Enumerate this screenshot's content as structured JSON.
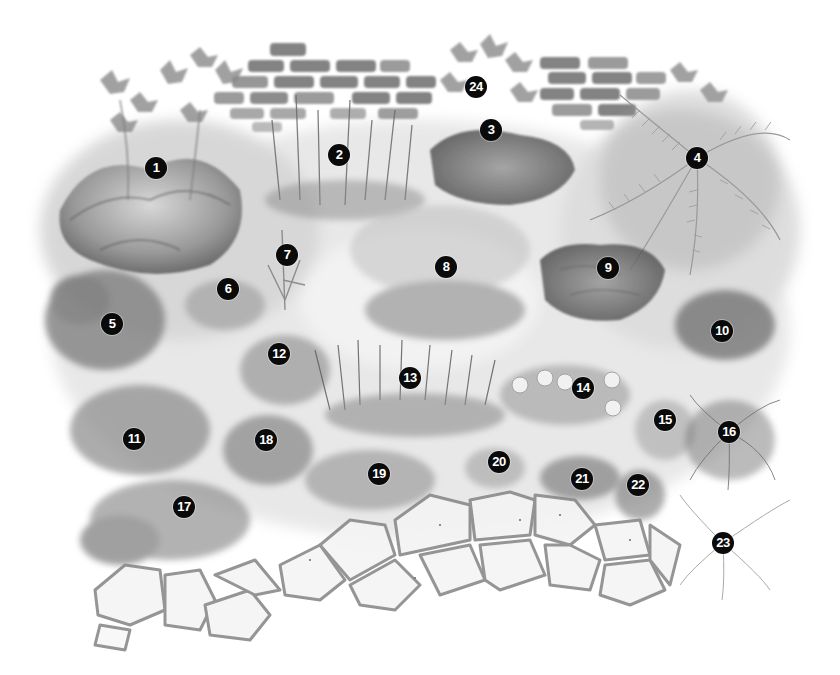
{
  "illustration": {
    "subject": "Watercolor garden border planting plan, grayscale",
    "background": "#ffffff",
    "elements": [
      "brick-wall-left",
      "brick-wall-right",
      "climbing-vines",
      "mixed-perennials",
      "ferns",
      "curved-flagstone-path"
    ]
  },
  "markers": [
    {
      "label": "1",
      "x": 156,
      "y": 168
    },
    {
      "label": "2",
      "x": 339,
      "y": 155
    },
    {
      "label": "3",
      "x": 491,
      "y": 130
    },
    {
      "label": "4",
      "x": 697,
      "y": 158
    },
    {
      "label": "5",
      "x": 112,
      "y": 324
    },
    {
      "label": "6",
      "x": 228,
      "y": 289
    },
    {
      "label": "7",
      "x": 287,
      "y": 255
    },
    {
      "label": "8",
      "x": 446,
      "y": 267
    },
    {
      "label": "9",
      "x": 608,
      "y": 268
    },
    {
      "label": "10",
      "x": 722,
      "y": 331
    },
    {
      "label": "11",
      "x": 134,
      "y": 439
    },
    {
      "label": "12",
      "x": 279,
      "y": 354
    },
    {
      "label": "13",
      "x": 410,
      "y": 378
    },
    {
      "label": "14",
      "x": 583,
      "y": 388
    },
    {
      "label": "15",
      "x": 665,
      "y": 420
    },
    {
      "label": "16",
      "x": 729,
      "y": 432
    },
    {
      "label": "17",
      "x": 184,
      "y": 507
    },
    {
      "label": "18",
      "x": 266,
      "y": 440
    },
    {
      "label": "19",
      "x": 379,
      "y": 474
    },
    {
      "label": "20",
      "x": 499,
      "y": 462
    },
    {
      "label": "21",
      "x": 582,
      "y": 479
    },
    {
      "label": "22",
      "x": 638,
      "y": 485
    },
    {
      "label": "23",
      "x": 723,
      "y": 543
    },
    {
      "label": "24",
      "x": 476,
      "y": 87
    }
  ],
  "colors": {
    "marker_fill": "#0a0a0a",
    "marker_text": "#ffffff",
    "brick": "#6e6e6e",
    "foliage_dark": "#5a5a5a",
    "foliage_mid": "#8c8c8c",
    "foliage_light": "#c4c4c4",
    "path_joint": "#8a8a8a",
    "path_stone": "#f2f2f2"
  }
}
